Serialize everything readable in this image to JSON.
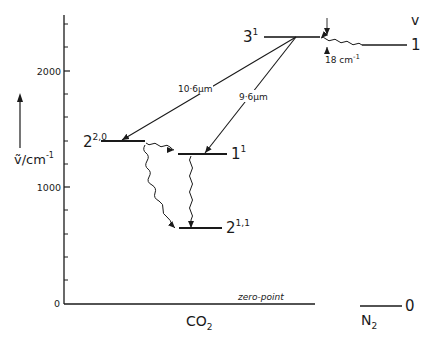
{
  "diagram": {
    "title": "",
    "y_axis": {
      "label": "ṽ/cm⁻¹",
      "label_main": "ṽ/cm",
      "label_exp": "-1",
      "ticks": [
        "0",
        "1000",
        "2000"
      ],
      "range": [
        0,
        2400
      ],
      "minor_step": 200
    },
    "molecules": {
      "co2": {
        "label": "CO",
        "sub": "2"
      },
      "n2": {
        "label": "N",
        "sub": "2"
      }
    },
    "column_header": "v",
    "levels": [
      {
        "id": "co2-3-1",
        "base": "3",
        "sup": "1",
        "value": 2292,
        "molecule": "CO2"
      },
      {
        "id": "co2-2-20",
        "base": "2",
        "sup": "2,0",
        "value": 1400,
        "molecule": "CO2"
      },
      {
        "id": "co2-1-1",
        "base": "1",
        "sup": "1",
        "value": 1285,
        "molecule": "CO2"
      },
      {
        "id": "co2-2-11",
        "base": "2",
        "sup": "1,1",
        "value": 650,
        "molecule": "CO2"
      },
      {
        "id": "n2-v1",
        "base": "1",
        "sup": "",
        "value": 2330,
        "molecule": "N2"
      },
      {
        "id": "n2-v0",
        "base": "0",
        "sup": "",
        "value": 0,
        "molecule": "N2"
      }
    ],
    "transitions": [
      {
        "from": "co2-3-1",
        "to": "co2-2-20",
        "label": "10·6μm",
        "type": "radiative"
      },
      {
        "from": "co2-3-1",
        "to": "co2-1-1",
        "label": "9·6μm",
        "type": "radiative"
      },
      {
        "from": "co2-2-20",
        "to": "co2-1-1",
        "label": "",
        "type": "nonradiative"
      },
      {
        "from": "co2-2-20",
        "to": "co2-2-11",
        "label": "",
        "type": "nonradiative"
      },
      {
        "from": "co2-1-1",
        "to": "co2-2-11",
        "label": "",
        "type": "nonradiative"
      },
      {
        "from": "n2-v1",
        "to": "co2-3-1",
        "label": "",
        "type": "energy-transfer"
      }
    ],
    "gap_annotation": "18 cm⁻¹",
    "gap_main": "18 cm",
    "gap_exp": "-1",
    "zero_point_label": "zero-point"
  }
}
